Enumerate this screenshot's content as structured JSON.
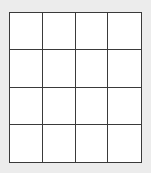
{
  "grid": {
    "rows": 4,
    "cols": 4,
    "cells": [
      [
        "",
        "",
        "",
        ""
      ],
      [
        "",
        "",
        "",
        ""
      ],
      [
        "",
        "",
        "",
        ""
      ],
      [
        "",
        "",
        "",
        ""
      ]
    ],
    "colors": {
      "background": "#ececec",
      "cell_fill": "#ffffff",
      "line": "#3a3a3a"
    }
  }
}
